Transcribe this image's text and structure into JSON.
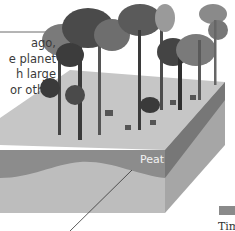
{
  "caption": {
    "lines": [
      "ago,",
      "e planet",
      "h large",
      "or other"
    ]
  },
  "labels": {
    "peat": "Peat",
    "legend_label": "Tim"
  },
  "colors": {
    "top_face": "#c4c4c4",
    "front_face": "#bdbdbd",
    "peat_band": "#8f8f8f",
    "side_face": "#a3a3a3",
    "side_band": "#7a7a7a",
    "tree_dark": "#3c3c3c",
    "tree_mid": "#6a6a6a",
    "tree_light": "#9a9a9a"
  }
}
